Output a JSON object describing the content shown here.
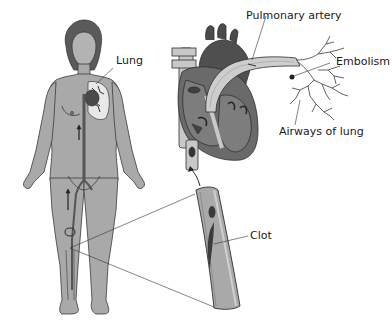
{
  "figure": {
    "labels": {
      "lung": "Lung",
      "pulmonary_artery": "Pulmonary artery",
      "embolism": "Embolism",
      "airways_of_lung": "Airways of lung",
      "clot": "Clot"
    },
    "components": [
      "human-figure",
      "heart-cross-section",
      "lung-airways",
      "vein-segment-with-clot"
    ],
    "colors": {
      "skin": "#a9a9a9",
      "outline": "#3a3a3a",
      "heart_dark": "#555555",
      "heart_mid": "#8a8a8a",
      "vessel_light": "#c8c8c8",
      "clot": "#3c3c3c",
      "background": "#ffffff"
    }
  }
}
